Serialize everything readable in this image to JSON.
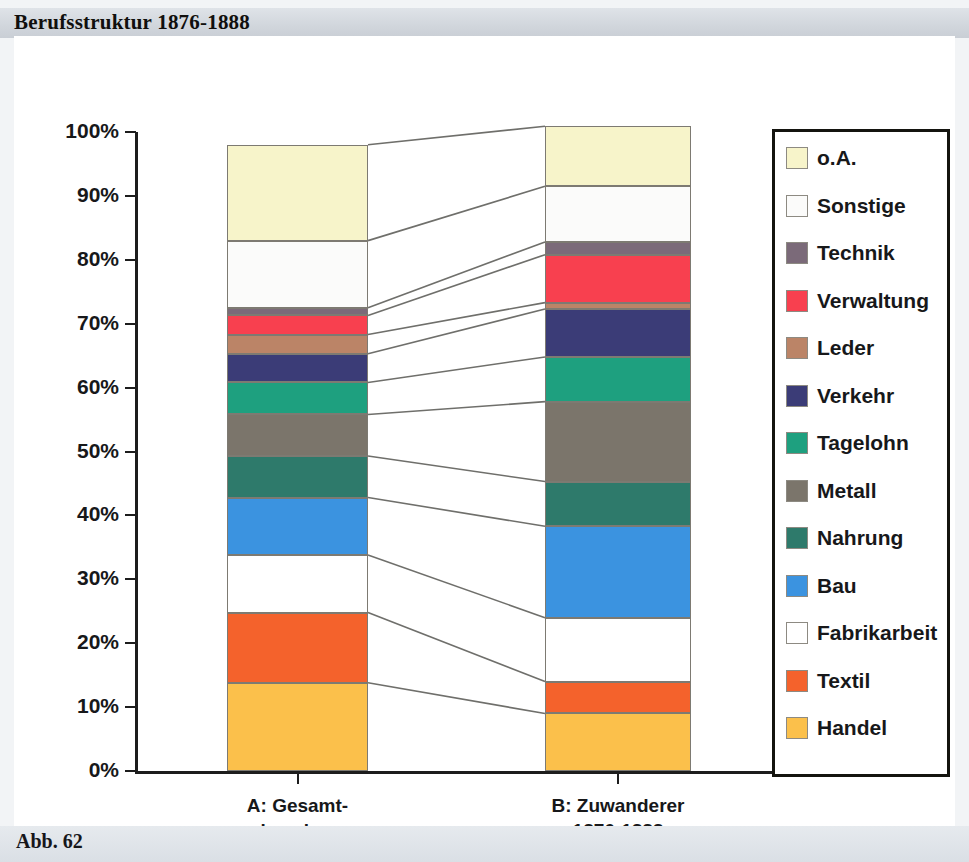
{
  "header": {
    "title": "Berufsstruktur 1876-1888"
  },
  "footer": {
    "caption": "Abb. 62"
  },
  "axis": {
    "y_ticks": [
      "100%",
      "90%",
      "80%",
      "70%",
      "60%",
      "50%",
      "40%",
      "30%",
      "20%",
      "10%",
      "0%"
    ]
  },
  "categories": [
    {
      "id": "A",
      "line1": "A: Gesamt-",
      "line2": "einwohner",
      "line3": "1880/81"
    },
    {
      "id": "B",
      "line1": "B: Zuwanderer",
      "line2": "1876-1888",
      "line3": ""
    }
  ],
  "legend": {
    "items": [
      {
        "label": "o.A.",
        "color": "#f7f4ca"
      },
      {
        "label": "Sonstige",
        "color": "#fbfbfa"
      },
      {
        "label": "Technik",
        "color": "#7b6a79"
      },
      {
        "label": "Verwaltung",
        "color": "#f8404f"
      },
      {
        "label": "Leder",
        "color": "#bb8467"
      },
      {
        "label": "Verkehr",
        "color": "#3b3c77"
      },
      {
        "label": "Tagelohn",
        "color": "#1ea07f"
      },
      {
        "label": "Metall",
        "color": "#7b756b"
      },
      {
        "label": "Nahrung",
        "color": "#2e7a6b"
      },
      {
        "label": "Bau",
        "color": "#3b93e0"
      },
      {
        "label": "Fabrikarbeit",
        "color": "#ffffff"
      },
      {
        "label": "Textil",
        "color": "#f4622c"
      },
      {
        "label": "Handel",
        "color": "#fbc04b"
      }
    ]
  },
  "chart_data": {
    "type": "bar",
    "subtype": "stacked-100-percent",
    "title": "Berufsstruktur 1876-1888",
    "xlabel": "",
    "ylabel": "",
    "ylim": [
      0,
      100
    ],
    "yunit": "%",
    "grid": false,
    "legend_position": "right",
    "categories": [
      "A: Gesamteinwohner 1880/81",
      "B: Zuwanderer 1876-1888"
    ],
    "stack_order_bottom_to_top": [
      "Handel",
      "Textil",
      "Fabrikarbeit",
      "Bau",
      "Nahrung",
      "Metall",
      "Tagelohn",
      "Verkehr",
      "Leder",
      "Verwaltung",
      "Technik",
      "Sonstige",
      "o.A."
    ],
    "series": [
      {
        "name": "Handel",
        "color": "#fbc04b",
        "values": [
          13.8,
          9.0
        ]
      },
      {
        "name": "Textil",
        "color": "#f4622c",
        "values": [
          11.0,
          5.0
        ]
      },
      {
        "name": "Fabrikarbeit",
        "color": "#ffffff",
        "values": [
          9.0,
          10.0
        ]
      },
      {
        "name": "Bau",
        "color": "#3b93e0",
        "values": [
          9.0,
          14.3
        ]
      },
      {
        "name": "Nahrung",
        "color": "#2e7a6b",
        "values": [
          6.5,
          7.0
        ]
      },
      {
        "name": "Metall",
        "color": "#7b756b",
        "values": [
          6.5,
          12.5
        ]
      },
      {
        "name": "Tagelohn",
        "color": "#1ea07f",
        "values": [
          5.0,
          7.0
        ]
      },
      {
        "name": "Verkehr",
        "color": "#3b3c77",
        "values": [
          4.5,
          7.5
        ]
      },
      {
        "name": "Leder",
        "color": "#bb8467",
        "values": [
          3.0,
          1.0
        ]
      },
      {
        "name": "Verwaltung",
        "color": "#f8404f",
        "values": [
          3.0,
          7.5
        ]
      },
      {
        "name": "Technik",
        "color": "#7b6a79",
        "values": [
          1.2,
          2.0
        ]
      },
      {
        "name": "Sonstige",
        "color": "#fbfbfa",
        "values": [
          10.5,
          8.7
        ]
      },
      {
        "name": "o.A.",
        "color": "#f7f4ca",
        "values": [
          15.0,
          9.4
        ]
      }
    ],
    "cumulative_tops_percent": {
      "A": [
        13.8,
        24.8,
        33.8,
        42.8,
        49.3,
        55.8,
        60.8,
        65.3,
        68.3,
        71.3,
        72.5,
        83.0,
        98.0
      ],
      "B": [
        9.0,
        14.0,
        24.0,
        38.3,
        45.3,
        57.8,
        64.8,
        72.3,
        73.3,
        80.8,
        82.8,
        91.5,
        100.9
      ]
    },
    "connectors": true
  },
  "geometry": {
    "plot": {
      "left": 121,
      "top": 96,
      "bottom": 735,
      "height": 639
    },
    "barA": {
      "x": 213,
      "w": 141
    },
    "barB": {
      "x": 531,
      "w": 146
    }
  }
}
